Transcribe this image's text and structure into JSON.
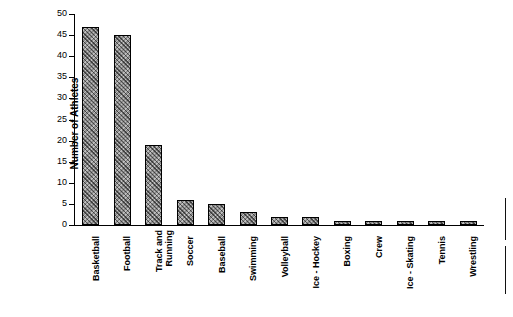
{
  "chart_data": {
    "type": "bar",
    "title": "",
    "xlabel": "",
    "ylabel": "Number of Athletes",
    "ylim": [
      0,
      50
    ],
    "ytick_step": 5,
    "yticks": [
      "0",
      "5",
      "10",
      "15",
      "20",
      "25",
      "30",
      "35",
      "40",
      "45",
      "50"
    ],
    "grid": false,
    "legend": false,
    "bar_color": "#8c8c8c",
    "bar_pattern": "cross-hatch",
    "categories": [
      "Basketball",
      "Football",
      "Track and\nRunning",
      "Soccer",
      "Baseball",
      "Swimming",
      "Volleyball",
      "Ice - Hockey",
      "Boxing",
      "Crew",
      "Ice - Skating",
      "Tennis",
      "Wrestling"
    ],
    "values": [
      47,
      45,
      19,
      6,
      5,
      3,
      2,
      2,
      1,
      1,
      1,
      1,
      1
    ]
  }
}
